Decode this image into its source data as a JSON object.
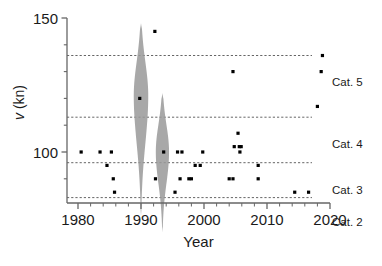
{
  "chart_data": {
    "type": "scatter",
    "title": "",
    "xlabel": "Year",
    "ylabel": "v (kn)",
    "xlim": [
      1979,
      2021
    ],
    "ylim": [
      72,
      150
    ],
    "grid": false,
    "legend": "none",
    "x_ticks": [
      1980,
      1990,
      2000,
      2010,
      2020
    ],
    "x_tick_labels": [
      "1980",
      "1990",
      "2000",
      "2010",
      "2020"
    ],
    "x_minor_tick_interval": 2,
    "y_ticks": [
      100,
      150
    ],
    "y_tick_labels": [
      "100",
      "150"
    ],
    "y_minor_tick_interval": 10,
    "category_lines": [
      {
        "label": "Cat. 5",
        "value": 136,
        "label_y": 126
      },
      {
        "label": "Cat. 4",
        "value": 113,
        "label_y": 103
      },
      {
        "label": "Cat. 3",
        "value": 96,
        "label_y": 86
      },
      {
        "label": "Cat. 2",
        "value": 83,
        "label_y": 74
      }
    ],
    "points": [
      {
        "x": 1980.5,
        "y": 100
      },
      {
        "x": 1983.5,
        "y": 100
      },
      {
        "x": 1985.3,
        "y": 100
      },
      {
        "x": 1984.6,
        "y": 95
      },
      {
        "x": 1985.6,
        "y": 90
      },
      {
        "x": 1985.8,
        "y": 85
      },
      {
        "x": 1989.8,
        "y": 120
      },
      {
        "x": 1992.2,
        "y": 145
      },
      {
        "x": 1992.3,
        "y": 90
      },
      {
        "x": 1993.6,
        "y": 100
      },
      {
        "x": 1995.4,
        "y": 85
      },
      {
        "x": 1995.8,
        "y": 100
      },
      {
        "x": 1996.5,
        "y": 100
      },
      {
        "x": 1996.2,
        "y": 90
      },
      {
        "x": 1997.6,
        "y": 90
      },
      {
        "x": 1998.0,
        "y": 90
      },
      {
        "x": 1998.6,
        "y": 95
      },
      {
        "x": 1999.4,
        "y": 95
      },
      {
        "x": 1999.8,
        "y": 100
      },
      {
        "x": 2004.0,
        "y": 90
      },
      {
        "x": 2004.6,
        "y": 90
      },
      {
        "x": 2004.6,
        "y": 130
      },
      {
        "x": 2004.8,
        "y": 102
      },
      {
        "x": 2005.6,
        "y": 102
      },
      {
        "x": 2005.9,
        "y": 102
      },
      {
        "x": 2005.4,
        "y": 107
      },
      {
        "x": 2005.7,
        "y": 100
      },
      {
        "x": 2008.6,
        "y": 95
      },
      {
        "x": 2008.6,
        "y": 90
      },
      {
        "x": 2014.4,
        "y": 85
      },
      {
        "x": 2016.6,
        "y": 85
      },
      {
        "x": 2018.0,
        "y": 117
      },
      {
        "x": 2018.8,
        "y": 136
      },
      {
        "x": 2018.6,
        "y": 130
      }
    ],
    "violins": [
      {
        "center_x": 1990.0,
        "y_min": 76,
        "y_max": 148,
        "peak_y": 121,
        "max_half_width_years": 1.15
      },
      {
        "center_x": 1993.4,
        "y_min": 70,
        "y_max": 122,
        "peak_y": 100,
        "max_half_width_years": 1.05
      }
    ],
    "violin_color": "#999999",
    "point_color": "#000000",
    "axis_color": "#666666",
    "dash_color": "#555555"
  }
}
